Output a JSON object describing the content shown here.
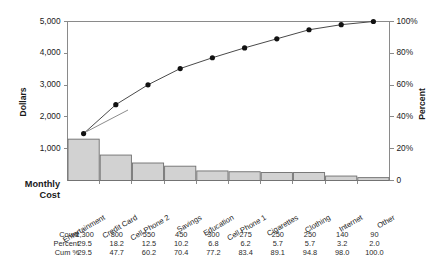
{
  "chart_data": {
    "type": "bar",
    "chart_kind": "pareto",
    "title": "",
    "subtitle": "",
    "categories": [
      "Entertainment",
      "Credit Card",
      "Cell Phone 2",
      "Savings",
      "Education",
      "Cell Phone 1",
      "Cigarettes",
      "Clothing",
      "Internet",
      "Other"
    ],
    "values": [
      1300,
      800,
      550,
      450,
      300,
      275,
      250,
      250,
      140,
      90
    ],
    "series": [
      {
        "name": "Count",
        "type": "bar",
        "axis": "left",
        "values": [
          1300,
          800,
          550,
          450,
          300,
          275,
          250,
          250,
          140,
          90
        ]
      },
      {
        "name": "Cum %",
        "type": "line",
        "axis": "right",
        "values": [
          29.5,
          47.7,
          60.2,
          70.4,
          77.2,
          83.4,
          89.1,
          94.8,
          98.0,
          100.0
        ]
      }
    ],
    "percent": [
      29.5,
      18.2,
      12.5,
      10.2,
      6.8,
      6.2,
      5.7,
      5.7,
      3.2,
      2.0
    ],
    "xlabel": "",
    "ylabel": "Dollars",
    "y2label": "Percent",
    "ylim": [
      0,
      5000
    ],
    "y2lim": [
      0,
      100
    ],
    "yticks": [
      1000,
      2000,
      3000,
      4000,
      5000
    ],
    "ytick_labels": [
      "1,000",
      "2,000",
      "3,000",
      "4,000",
      "5,000"
    ],
    "y2ticks": [
      0,
      20,
      40,
      60,
      80,
      100
    ],
    "y2tick_labels": [
      "0",
      "20%",
      "40%",
      "60%",
      "80%",
      "100%"
    ],
    "grid": false,
    "legend": "none",
    "corner_label": "Monthly Cost",
    "corner_label_lines": [
      "Monthly",
      "Cost"
    ],
    "bar_color": "#d2d2d2",
    "bar_edge_color": "#6e6e6e",
    "line_color": "#4a4a4a",
    "marker_color": "#121212",
    "axis_color": "#8a8a8a"
  },
  "table": {
    "row_labels": [
      "Count",
      "Percent",
      "Cum %"
    ],
    "rows": [
      {
        "label": "Count",
        "values": [
          "1,300",
          "800",
          "550",
          "450",
          "300",
          "275",
          "250",
          "250",
          "140",
          "90"
        ]
      },
      {
        "label": "Percent",
        "values": [
          "29.5",
          "18.2",
          "12.5",
          "10.2",
          "6.8",
          "6.2",
          "5.7",
          "5.7",
          "3.2",
          "2.0"
        ]
      },
      {
        "label": "Cum %",
        "values": [
          "29.5",
          "47.7",
          "60.2",
          "70.4",
          "77.2",
          "83.4",
          "89.1",
          "94.8",
          "98.0",
          "100.0"
        ]
      }
    ]
  }
}
